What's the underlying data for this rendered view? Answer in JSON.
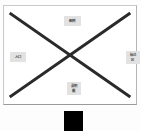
{
  "diagram": {
    "title": "",
    "panel": {
      "background_color": "#ffffff",
      "border_color": "#c9c9c9"
    },
    "cross": {
      "name": "x-cross-lines",
      "color": "#2a2a2a",
      "stroke_width": 3,
      "lines": [
        {
          "name": "diagonal-top-left-to-bottom-right",
          "x1": 7,
          "y1": 8,
          "x2": 127,
          "y2": 92
        },
        {
          "name": "diagonal-bottom-left-to-top-right",
          "x1": 7,
          "y1": 92,
          "x2": 127,
          "y2": 8
        }
      ]
    },
    "labels": [
      {
        "id": "top",
        "text": "图例",
        "color": "#3a3a3a",
        "background": "#e2e2e2"
      },
      {
        "id": "left",
        "text": "入口",
        "color": "#3a3a3a",
        "background": "#e2e2e2"
      },
      {
        "id": "right",
        "text": "标注\n区",
        "color": "#3a3a3a",
        "background": "#e2e2e2"
      },
      {
        "id": "bottom",
        "text": "说明\n框",
        "color": "#3a3a3a",
        "background": "#e2e2e2"
      }
    ],
    "black_block": {
      "name": "black-block",
      "color": "#000000"
    }
  }
}
